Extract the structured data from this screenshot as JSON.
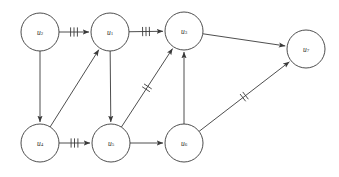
{
  "figure": {
    "kind": "directed-graph-diagram",
    "background_color": "#ffffff",
    "stroke_color": "#3a3a3a",
    "label_color": "#2b2b2b",
    "width": 339,
    "height": 177
  },
  "graph": {
    "node_radius": 19,
    "nodes": [
      {
        "id": "u2",
        "base": "u",
        "subscript": "2",
        "label": "u2",
        "cx": 40,
        "cy": 32
      },
      {
        "id": "u1",
        "base": "u",
        "subscript": "1",
        "label": "u1",
        "cx": 110,
        "cy": 32
      },
      {
        "id": "u3",
        "base": "u",
        "subscript": "3",
        "label": "u3",
        "cx": 184,
        "cy": 31
      },
      {
        "id": "u7",
        "base": "u",
        "subscript": "7",
        "label": "u7",
        "cx": 306,
        "cy": 49
      },
      {
        "id": "u4",
        "base": "u",
        "subscript": "4",
        "label": "u4",
        "cx": 40,
        "cy": 143
      },
      {
        "id": "u5",
        "base": "u",
        "subscript": "5",
        "label": "u5",
        "cx": 111,
        "cy": 143
      },
      {
        "id": "u6",
        "base": "u",
        "subscript": "6",
        "label": "u6",
        "cx": 184,
        "cy": 143
      }
    ],
    "edges": [
      {
        "id": "e-u2-u1",
        "from": "u2",
        "to": "u1",
        "ticks": 3,
        "directed": true
      },
      {
        "id": "e-u1-u3",
        "from": "u1",
        "to": "u3",
        "ticks": 3,
        "directed": true
      },
      {
        "id": "e-u2-u4",
        "from": "u2",
        "to": "u4",
        "ticks": 0,
        "directed": true
      },
      {
        "id": "e-u4-u5",
        "from": "u4",
        "to": "u5",
        "ticks": 3,
        "directed": true
      },
      {
        "id": "e-u4-u1",
        "from": "u4",
        "to": "u1",
        "ticks": 0,
        "directed": true
      },
      {
        "id": "e-u1-u5",
        "from": "u1",
        "to": "u5",
        "ticks": 0,
        "directed": true
      },
      {
        "id": "e-u5-u3",
        "from": "u5",
        "to": "u3",
        "ticks": 2,
        "directed": true
      },
      {
        "id": "e-u5-u6",
        "from": "u5",
        "to": "u6",
        "ticks": 0,
        "directed": true
      },
      {
        "id": "e-u6-u3",
        "from": "u6",
        "to": "u3",
        "ticks": 0,
        "directed": true
      },
      {
        "id": "e-u3-u7",
        "from": "u3",
        "to": "u7",
        "ticks": 0,
        "directed": true
      },
      {
        "id": "e-u6-u7",
        "from": "u6",
        "to": "u7",
        "ticks": 2,
        "directed": true
      }
    ]
  }
}
